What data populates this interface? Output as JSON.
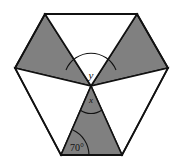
{
  "figure": {
    "name": "hexagon-with-six-triangles",
    "background_color": "#ffffff",
    "stroke_color": "#111111",
    "shaded_fill": "#808080",
    "unshaded_fill": "#ffffff",
    "stroke_width": 1.6,
    "hexagon": {
      "name": "outer-hexagon",
      "vertices": [
        {
          "name": "top-left",
          "x": 45,
          "y": 14
        },
        {
          "name": "top-right",
          "x": 137,
          "y": 14
        },
        {
          "name": "right",
          "x": 168,
          "y": 68
        },
        {
          "name": "bottom-right",
          "x": 122,
          "y": 155
        },
        {
          "name": "bottom-left",
          "x": 61,
          "y": 155
        },
        {
          "name": "left",
          "x": 15,
          "y": 68
        }
      ]
    },
    "center_point": {
      "name": "center-vertex",
      "x": 91,
      "y": 86
    },
    "triangles": [
      {
        "name": "triangle-top-left-shaded",
        "shaded": true,
        "points": "45,14 91,86 15,68"
      },
      {
        "name": "triangle-top-right-shaded",
        "shaded": true,
        "points": "137,14 168,68 91,86"
      },
      {
        "name": "triangle-top-white",
        "shaded": false,
        "points": "45,14 137,14 91,86"
      },
      {
        "name": "triangle-left-white",
        "shaded": false,
        "points": "15,68 91,86 61,155"
      },
      {
        "name": "triangle-right-white",
        "shaded": false,
        "points": "168,68 122,155 91,86"
      },
      {
        "name": "triangle-bottom-shaded",
        "shaded": true,
        "points": "91,86 122,155 61,155"
      }
    ]
  },
  "labels": {
    "angle_y": {
      "name": "angle-label-y",
      "text": "y",
      "x": 91,
      "y": 79,
      "font_size": 11,
      "italic": true,
      "arc": {
        "name": "angle-arc-y",
        "path": "M 66 70 A 27 27 0 0 1 116 70"
      }
    },
    "angle_x": {
      "name": "angle-label-x",
      "text": "x",
      "x": 91,
      "y": 103,
      "font_size": 9,
      "italic": true,
      "arc": {
        "name": "angle-arc-x",
        "path": "M 80 110 A 19 19 0 0 0 102 110"
      }
    },
    "angle_70": {
      "name": "angle-label-70-degrees",
      "text": "70°",
      "x": 77,
      "y": 151,
      "font_size": 10,
      "italic": false,
      "arc": {
        "name": "angle-arc-70-degrees",
        "path": "M 89 155 A 28 28 0 0 0 73 130"
      }
    }
  }
}
